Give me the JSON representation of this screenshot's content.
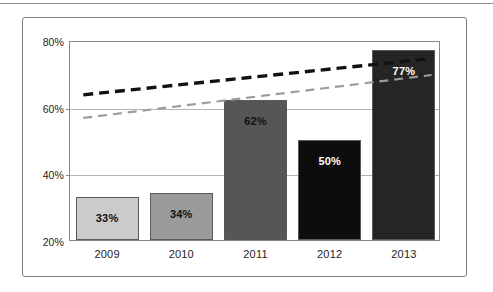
{
  "chart_data": {
    "type": "bar",
    "title": "",
    "subtitle": "",
    "xlabel": "",
    "ylabel": "",
    "categories": [
      "2009",
      "2010",
      "2011",
      "2012",
      "2013"
    ],
    "values": [
      33,
      34,
      62,
      50,
      77
    ],
    "value_labels": [
      "33%",
      "34%",
      "62%",
      "50%",
      "77%"
    ],
    "bar_colors": [
      "#cbcbcb",
      "#9a9a9a",
      "#565656",
      "#0d0d0d",
      "#252525"
    ],
    "bar_label_colors": [
      "#111111",
      "#111111",
      "#111111",
      "#ffffff",
      "#ffffff"
    ],
    "bar_border_color": "#5a5a5a",
    "ylim": [
      20,
      80
    ],
    "yticks": [
      20,
      40,
      60,
      80
    ],
    "ytick_labels": [
      "20%",
      "40%",
      "60%",
      "80%"
    ],
    "grid": true,
    "gridline_color": "#b4b4b4",
    "axis_color": "#8a8a8a",
    "legend": "none",
    "series": [
      {
        "name": "bars",
        "type": "bar",
        "categories": [
          "2009",
          "2010",
          "2011",
          "2012",
          "2013"
        ],
        "values": [
          33,
          34,
          62,
          50,
          77
        ]
      },
      {
        "name": "upper-trendline",
        "type": "line",
        "style": "dashed",
        "color": "#111111",
        "thickness": 3,
        "start_value": 64,
        "end_value": 75,
        "x": [
          "2009",
          "2013"
        ],
        "values": [
          64,
          75
        ]
      },
      {
        "name": "lower-trendline",
        "type": "line",
        "style": "dashed",
        "color": "#9c9c9c",
        "thickness": 2,
        "start_value": 57,
        "end_value": 70,
        "x": [
          "2009",
          "2013"
        ],
        "values": [
          57,
          70
        ]
      }
    ]
  },
  "figure": {
    "frame_color": "#7d7d7d",
    "background": "#ffffff",
    "top_rule_color": "#8d8d8d"
  }
}
